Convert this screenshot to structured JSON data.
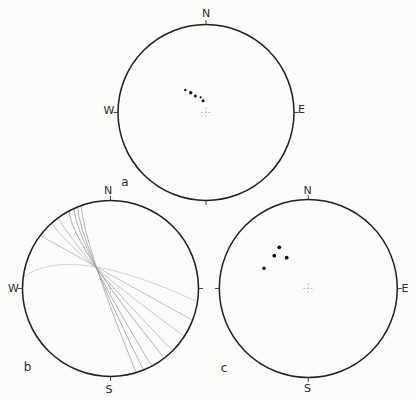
{
  "figure": {
    "background": "#fcfcfb",
    "ink": "#1f1f1f",
    "dot_color": "#111111",
    "cross_color": "#b5b5b5",
    "tick_len": 4.5,
    "panels": [
      {
        "id": "a",
        "tag": {
          "text": "a",
          "x": 125,
          "y": 182
        },
        "center": [
          206,
          112.5
        ],
        "radius": 88,
        "labels": [
          {
            "dir": "n",
            "text": "N",
            "x": 206,
            "y": 13.5
          },
          {
            "dir": "w",
            "text": "W",
            "x": 109,
            "y": 110.5
          },
          {
            "dir": "e",
            "text": "E",
            "x": 301.5,
            "y": 109
          }
        ],
        "points": [
          {
            "x": 185.3,
            "y": 90,
            "r": 1.2
          },
          {
            "x": 190.7,
            "y": 92.8,
            "r": 1.7
          },
          {
            "x": 195.3,
            "y": 96,
            "r": 1.5
          },
          {
            "x": 200.7,
            "y": 97.3,
            "r": 1.1
          },
          {
            "x": 203,
            "y": 100.7,
            "r": 1.5
          }
        ],
        "arcs": [],
        "artifacts": [
          {
            "x1": 291.5,
            "y1": 140,
            "x2": 294.5,
            "y2": 144.5,
            "color": "#c9c9c9",
            "w": 0.8
          }
        ]
      },
      {
        "id": "b",
        "tag": {
          "text": "b",
          "x": 27.5,
          "y": 366.5
        },
        "center": [
          110.5,
          288.5
        ],
        "radius": 88,
        "labels": [
          {
            "dir": "n",
            "text": "N",
            "x": 108,
            "y": 190.5
          },
          {
            "dir": "w",
            "text": "W",
            "x": 13.5,
            "y": 288
          },
          {
            "dir": "s",
            "text": "S",
            "x": 109,
            "y": 389.5
          }
        ],
        "points": [],
        "arcs": [
          {
            "p0": [
              23.2,
              277.3
            ],
            "c": [
              69.65,
              242.45
            ],
            "p2": [
              197.5,
              301.8
            ],
            "color": "#c2c2c2",
            "w": 0.7
          },
          {
            "p0": [
              40.2,
              235.5
            ],
            "c": [
              69.65,
              252.1
            ],
            "p2": [
              192.5,
              320.3
            ],
            "color": "#a6a6a6",
            "w": 0.7
          },
          {
            "p0": [
              51.6,
              223.1
            ],
            "c": [
              72.05,
              254.25
            ],
            "p2": [
              184.3,
              336.4
            ],
            "color": "#b0b0b0",
            "w": 0.7
          },
          {
            "p0": [
              58.2,
              217.8
            ],
            "c": [
              76.55,
              251.75
            ],
            "p2": [
              172.7,
              350.7
            ],
            "color": "#a6a6a6",
            "w": 0.7
          },
          {
            "p0": [
              69.2,
              210.8
            ],
            "c": [
              70.25,
              241.55
            ],
            "p2": [
              164.3,
              358.1
            ],
            "color": "#9a9a9a",
            "w": 0.8
          },
          {
            "p0": [
              74.0,
              208.4
            ],
            "c": [
              76.1,
              241.7
            ],
            "p2": [
              151.8,
              366.2
            ],
            "color": "#a2a2a2",
            "w": 0.8
          },
          {
            "p0": [
              77.5,
              206.9
            ],
            "c": [
              80.5,
              243.5
            ],
            "p2": [
              143.5,
              370.1
            ],
            "color": "#9a9a9a",
            "w": 0.8
          },
          {
            "p0": [
              81.1,
              205.6
            ],
            "c": [
              84.35,
              245.85
            ],
            "p2": [
              136.2,
              372.7
            ],
            "color": "#a2a2a2",
            "w": 0.8
          }
        ],
        "artifacts": []
      },
      {
        "id": "c",
        "tag": {
          "text": "c",
          "x": 224,
          "y": 368
        },
        "center": [
          308.3,
          288.5
        ],
        "radius": 89,
        "labels": [
          {
            "dir": "n",
            "text": "N",
            "x": 307.5,
            "y": 190.5
          },
          {
            "dir": "e",
            "text": "E",
            "x": 405,
            "y": 288
          },
          {
            "dir": "s",
            "text": "S",
            "x": 307.5,
            "y": 388.5
          }
        ],
        "points": [
          {
            "x": 279.3,
            "y": 247.3,
            "r": 1.9
          },
          {
            "x": 274.3,
            "y": 255.7,
            "r": 1.9
          },
          {
            "x": 286.7,
            "y": 257.7,
            "r": 1.9
          },
          {
            "x": 264,
            "y": 268.3,
            "r": 1.8
          }
        ],
        "arcs": [],
        "artifacts": []
      }
    ]
  },
  "chart_data": [
    {
      "type": "scatter",
      "title": "Stereonet a",
      "panel_label": "a",
      "compass_labels": [
        "N",
        "W",
        "E"
      ],
      "description": "Equal-area lower-hemisphere projection; 5 small pole points clustered just NW of the centre cross, trending NW-SE",
      "points_px": [
        [
          185.3,
          90
        ],
        [
          190.7,
          92.8
        ],
        [
          195.3,
          96
        ],
        [
          200.7,
          97.3
        ],
        [
          203,
          100.7
        ]
      ],
      "center_px": [
        206,
        112.5
      ],
      "radius_px": 88
    },
    {
      "type": "line",
      "title": "Stereonet b",
      "panel_label": "b",
      "compass_labels": [
        "N",
        "W",
        "S"
      ],
      "description": "Equal-area projection with 8 thin great-circle traces intersecting near a common point NW of centre and fanning out to the SSE-SE edge",
      "n_great_circles": 8,
      "intersection_point_px": [
        94,
        266
      ],
      "center_px": [
        110.5,
        288.5
      ],
      "radius_px": 88
    },
    {
      "type": "scatter",
      "title": "Stereonet c",
      "panel_label": "c",
      "compass_labels": [
        "N",
        "E",
        "S"
      ],
      "description": "Equal-area projection; 4 larger pole points in the NW quadrant, centre marked with a light dashed cross",
      "points_px": [
        [
          279.3,
          247.3
        ],
        [
          274.3,
          255.7
        ],
        [
          286.7,
          257.7
        ],
        [
          264,
          268.3
        ]
      ],
      "center_px": [
        308.3,
        288.5
      ],
      "radius_px": 89
    }
  ]
}
